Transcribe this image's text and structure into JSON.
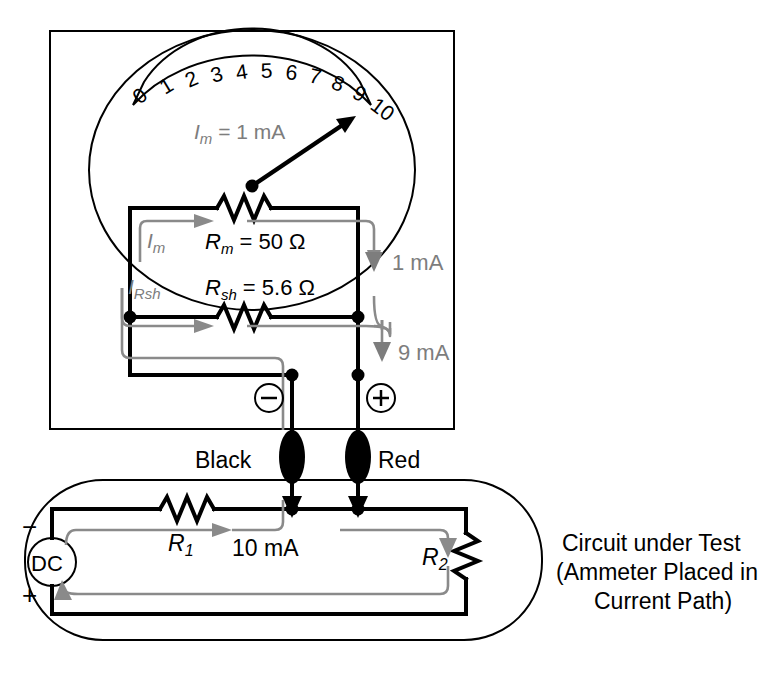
{
  "figure": {
    "colors": {
      "wire": "#000000",
      "flow_arrow": "#8a8a8a",
      "label_gray": "#7d7d7d",
      "background": "#ffffff"
    }
  },
  "meter": {
    "scale_numbers": [
      "0",
      "1",
      "2",
      "3",
      "4",
      "5",
      "6",
      "7",
      "8",
      "9",
      "10"
    ],
    "reading_label": "I",
    "reading_sub": "m",
    "reading_value": " = 1 mA",
    "needle_points_to": "10",
    "terminals": {
      "negative": "⊖",
      "positive": "⊕"
    }
  },
  "components": {
    "rm": {
      "name": "R",
      "sub": "m",
      "value": " = 50 Ω"
    },
    "rsh": {
      "name": "R",
      "sub": "sh",
      "value": " = 5.6 Ω"
    },
    "im_label": {
      "name": "I",
      "sub": "m"
    },
    "irsh_label": {
      "name": "I",
      "sub": "Rsh"
    }
  },
  "currents": {
    "through_meter": "1 mA",
    "through_shunt": "9 mA",
    "total": "10 mA"
  },
  "probes": {
    "black": "Black",
    "red": "Red"
  },
  "dut": {
    "source": "DC",
    "minus": "−",
    "plus": "+",
    "r1": {
      "name": "R",
      "sub": "1"
    },
    "r2": {
      "name": "R",
      "sub": "2"
    },
    "caption_line1": "Circuit under Test",
    "caption_line2": "(Ammeter Placed in",
    "caption_line3": "Current Path)"
  }
}
